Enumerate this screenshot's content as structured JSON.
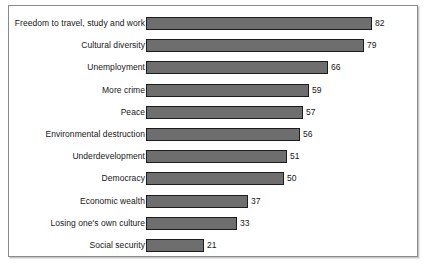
{
  "chart_data": {
    "type": "bar",
    "orientation": "horizontal",
    "title": "",
    "subtitle": "",
    "xlabel": "",
    "ylabel": "",
    "xlim": [
      0,
      82
    ],
    "grid": false,
    "legend": false,
    "show_value_labels": true,
    "bar_color": "#6e6e6e",
    "bar_border_color": "#1c1c1c",
    "frame_border_color": "#8a8a8a",
    "background_color": "#ffffff",
    "text_color": "#161616",
    "categories": [
      "Freedom to travel, study and work",
      "Cultural diversity",
      "Unemployment",
      "More crime",
      "Peace",
      "Environmental destruction",
      "Underdevelopment",
      "Democracy",
      "Economic wealth",
      "Losing one's own culture",
      "Social security"
    ],
    "values": [
      82,
      79,
      66,
      59,
      57,
      56,
      51,
      50,
      37,
      33,
      21
    ],
    "value_labels": [
      "82",
      "79",
      "66",
      "59",
      "57",
      "56",
      "51",
      "50",
      "37",
      "33",
      "21"
    ]
  }
}
